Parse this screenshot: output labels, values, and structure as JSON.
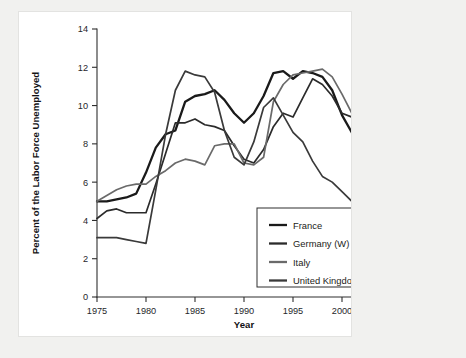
{
  "figure": {
    "background_color": "#f1f1ef",
    "card_color": "#ffffff"
  },
  "chart_data": {
    "type": "line",
    "title": "",
    "xlabel": "Year",
    "ylabel": "Percent of the Labor Force Unemployed",
    "xlim": [
      1975,
      2005
    ],
    "ylim": [
      0,
      14
    ],
    "xticks": [
      1975,
      1980,
      1985,
      1990,
      1995,
      2000,
      2005
    ],
    "xtick_labels": [
      "1975",
      "1980",
      "1985",
      "1990",
      "1995",
      "2000",
      "2005"
    ],
    "yticks": [
      0,
      2,
      4,
      6,
      8,
      10,
      12,
      14
    ],
    "ytick_labels": [
      "0",
      "2",
      "4",
      "6",
      "8",
      "10",
      "12",
      "14"
    ],
    "grid": false,
    "legend_position": "lower right",
    "x": [
      1975,
      1976,
      1977,
      1978,
      1979,
      1980,
      1981,
      1982,
      1983,
      1984,
      1985,
      1986,
      1987,
      1988,
      1989,
      1990,
      1991,
      1992,
      1993,
      1994,
      1995,
      1996,
      1997,
      1998,
      1999,
      2000,
      2001,
      2002,
      2003,
      2004
    ],
    "series": [
      {
        "name": "France",
        "color": "#1a1a1a",
        "width": 2.3,
        "values": [
          5.0,
          5.0,
          5.1,
          5.2,
          5.4,
          6.5,
          7.8,
          8.5,
          8.7,
          10.2,
          10.5,
          10.6,
          10.8,
          10.3,
          9.6,
          9.1,
          9.6,
          10.5,
          11.7,
          11.8,
          11.4,
          11.8,
          11.7,
          11.5,
          10.8,
          9.5,
          8.6,
          8.8,
          9.3,
          9.7
        ],
        "values_display": [
          5.0,
          5.0,
          5.1,
          5.2,
          5.4,
          6.5,
          7.8,
          8.5,
          8.7,
          10.2,
          10.5,
          10.6,
          10.8,
          10.3,
          9.6,
          9.1,
          9.6,
          10.5,
          11.7,
          11.8,
          11.4,
          11.8,
          11.7,
          11.5,
          10.8,
          9.5,
          8.6,
          8.8,
          9.3,
          9.7
        ]
      },
      {
        "name": "Germany (W)",
        "color": "#2b2b2b",
        "width": 1.7,
        "values": [
          4.1,
          4.5,
          4.6,
          4.4,
          4.4,
          4.4,
          5.9,
          7.5,
          9.1,
          9.1,
          9.3,
          9.0,
          8.9,
          8.7,
          7.9,
          7.2,
          7.0,
          7.7,
          8.9,
          9.6,
          9.4,
          10.4,
          11.4,
          11.1,
          10.5,
          9.6,
          9.4,
          9.8,
          10.5,
          10.6
        ],
        "values_display": [
          4.1,
          4.5,
          4.6,
          4.4,
          4.4,
          4.4,
          5.9,
          7.5,
          9.1,
          9.1,
          9.3,
          9.0,
          8.9,
          8.7,
          7.9,
          7.2,
          7.0,
          7.7,
          8.9,
          9.6,
          9.4,
          10.4,
          11.4,
          11.1,
          10.5,
          9.6,
          9.4,
          9.8,
          10.5,
          10.6
        ]
      },
      {
        "name": "Italy",
        "color": "#6a6a6a",
        "width": 1.7,
        "values": [
          5.0,
          5.3,
          5.6,
          5.8,
          5.9,
          5.9,
          6.3,
          6.6,
          7.0,
          7.2,
          7.1,
          6.9,
          7.9,
          8.0,
          8.0,
          7.0,
          6.9,
          7.3,
          10.2,
          11.1,
          11.6,
          11.7,
          11.8,
          11.9,
          11.5,
          10.6,
          9.6,
          9.0,
          8.7,
          8.7
        ],
        "values_display": [
          5.0,
          5.3,
          5.6,
          5.8,
          5.9,
          5.9,
          6.3,
          6.6,
          7.0,
          7.2,
          7.1,
          6.9,
          7.9,
          8.0,
          8.0,
          7.0,
          6.9,
          7.3,
          10.2,
          11.1,
          11.6,
          11.7,
          11.8,
          11.9,
          11.5,
          10.6,
          9.6,
          9.0,
          8.7,
          8.7
        ]
      },
      {
        "name": "United Kingdom",
        "color": "#3a3a3a",
        "width": 1.7,
        "values": [
          3.1,
          3.1,
          3.1,
          3.0,
          2.9,
          2.8,
          5.6,
          8.5,
          10.8,
          11.8,
          11.6,
          11.5,
          10.7,
          8.7,
          7.3,
          6.9,
          8.1,
          9.9,
          10.4,
          9.5,
          8.6,
          8.1,
          7.1,
          6.3,
          6.0,
          5.5,
          5.0,
          5.2,
          5.0,
          5.2
        ],
        "values_display": [
          3.1,
          3.1,
          3.1,
          3.0,
          2.9,
          2.8,
          5.6,
          8.5,
          10.8,
          11.8,
          11.6,
          11.5,
          10.7,
          8.7,
          7.3,
          6.9,
          8.1,
          9.9,
          10.4,
          9.5,
          8.6,
          8.1,
          7.1,
          6.3,
          6.0,
          5.5,
          5.0,
          5.2,
          5.0,
          5.2
        ]
      }
    ],
    "legend": [
      {
        "label": "France",
        "color": "#1a1a1a"
      },
      {
        "label": "Germany (W)",
        "color": "#2b2b2b"
      },
      {
        "label": "Italy",
        "color": "#6a6a6a"
      },
      {
        "label": "United Kingdom",
        "color": "#3a3a3a"
      }
    ]
  }
}
